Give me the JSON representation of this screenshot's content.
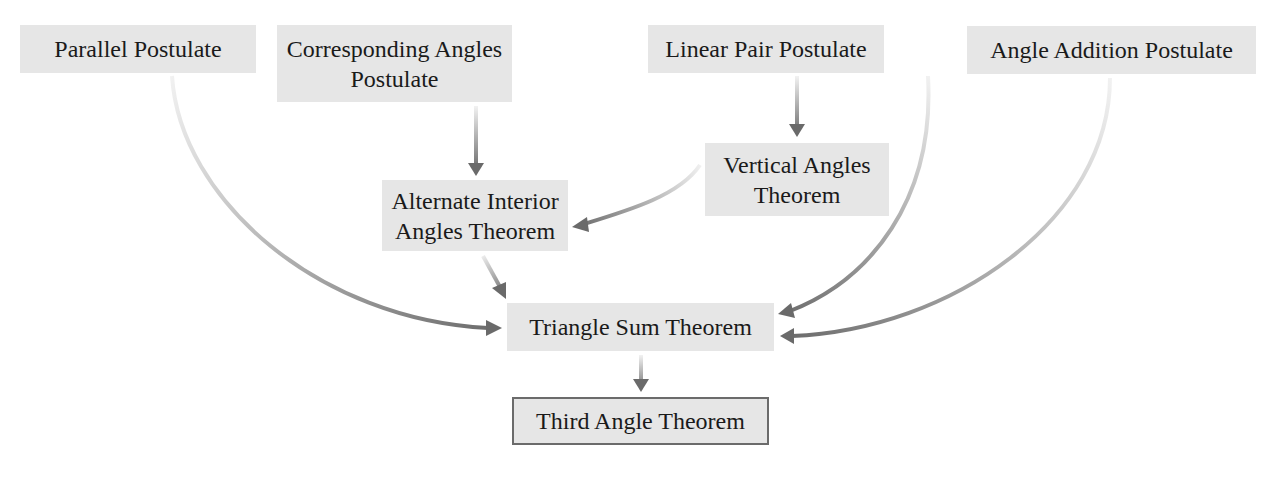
{
  "diagram": {
    "clipped_caption": "",
    "nodes": [
      {
        "id": "parallel",
        "label": "Parallel Postulate",
        "x": 20,
        "y": 25,
        "w": 236,
        "h": 48
      },
      {
        "id": "corresponding",
        "label": "Corresponding Angles Postulate",
        "line1": "Corresponding Angles",
        "line2": "Postulate",
        "x": 277,
        "y": 25,
        "w": 235,
        "h": 77
      },
      {
        "id": "linear_pair",
        "label": "Linear Pair Postulate",
        "x": 648,
        "y": 25,
        "w": 236,
        "h": 48
      },
      {
        "id": "angle_addition",
        "label": "Angle Addition Postulate",
        "x": 967,
        "y": 26,
        "w": 289,
        "h": 48
      },
      {
        "id": "alternate_interior",
        "label": "Alternate Interior Angles Theorem",
        "line1": "Alternate Interior",
        "line2": "Angles Theorem",
        "x": 382,
        "y": 180,
        "w": 186,
        "h": 71
      },
      {
        "id": "vertical_angles",
        "label": "Vertical Angles Theorem",
        "line1": "Vertical Angles",
        "line2": "Theorem",
        "x": 705,
        "y": 143,
        "w": 184,
        "h": 73
      },
      {
        "id": "triangle_sum",
        "label": "Triangle Sum Theorem",
        "x": 507,
        "y": 303,
        "w": 267,
        "h": 48
      },
      {
        "id": "third_angle",
        "label": "Third Angle Theorem",
        "x": 512,
        "y": 397,
        "w": 257,
        "h": 48,
        "outlined": true
      }
    ],
    "edges": [
      {
        "from": "corresponding",
        "to": "alternate_interior"
      },
      {
        "from": "linear_pair",
        "to": "vertical_angles"
      },
      {
        "from": "vertical_angles",
        "to": "alternate_interior"
      },
      {
        "from": "alternate_interior",
        "to": "triangle_sum"
      },
      {
        "from": "parallel",
        "to": "triangle_sum"
      },
      {
        "from": "linear_pair",
        "to": "triangle_sum"
      },
      {
        "from": "angle_addition",
        "to": "triangle_sum"
      },
      {
        "from": "triangle_sum",
        "to": "third_angle"
      }
    ],
    "colors": {
      "node_fill": "#e6e6e6",
      "arrow": "#6e6e6e",
      "final_border": "#6b6b6b"
    }
  }
}
